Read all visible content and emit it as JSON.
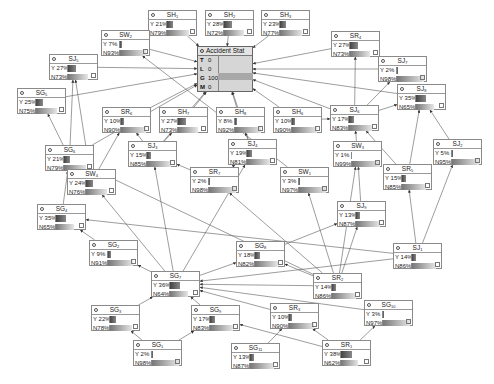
{
  "accident": {
    "title": "Accident Stat",
    "states": [
      {
        "key": "T",
        "value": "0"
      },
      {
        "key": "L",
        "value": "0"
      },
      {
        "key": "G",
        "value": "100%"
      },
      {
        "key": "M",
        "value": "0"
      }
    ]
  },
  "nodes": [
    {
      "id": "SH1",
      "name": "SH",
      "sub": "1",
      "y": "Y 21%",
      "n": "N79%",
      "yp": 21,
      "x": 148,
      "top": 10
    },
    {
      "id": "SH2",
      "name": "SH",
      "sub": "2",
      "y": "Y 28%",
      "n": "N72%",
      "yp": 28,
      "x": 205,
      "top": 10
    },
    {
      "id": "SH3",
      "name": "SH",
      "sub": "3",
      "y": "Y 23%",
      "n": "N77%",
      "yp": 23,
      "x": 261,
      "top": 10
    },
    {
      "id": "SR4",
      "name": "SR",
      "sub": "4",
      "y": "Y 27%",
      "n": "N73%",
      "yp": 27,
      "x": 331,
      "top": 31
    },
    {
      "id": "SW2",
      "name": "SW",
      "sub": "2",
      "y": "Y  7%",
      "n": "N93%",
      "yp": 7,
      "x": 101,
      "top": 30
    },
    {
      "id": "SJ5",
      "name": "SJ",
      "sub": "5",
      "y": "Y 27%",
      "n": "N73%",
      "yp": 27,
      "x": 49,
      "top": 54
    },
    {
      "id": "SJ7",
      "name": "SJ",
      "sub": "7",
      "y": "Y  2%",
      "n": "N98%",
      "yp": 2,
      "x": 378,
      "top": 56
    },
    {
      "id": "SG5",
      "name": "SG",
      "sub": "5",
      "y": "Y 25%",
      "n": "N75%",
      "yp": 25,
      "x": 17,
      "top": 88
    },
    {
      "id": "SJ8",
      "name": "SJ",
      "sub": "8",
      "y": "Y 35%",
      "n": "N65%",
      "yp": 35,
      "x": 397,
      "top": 84
    },
    {
      "id": "SR6",
      "name": "SR",
      "sub": "6",
      "y": "Y 10%",
      "n": "N90%",
      "yp": 10,
      "x": 102,
      "top": 107
    },
    {
      "id": "SH7",
      "name": "SH",
      "sub": "7",
      "y": "Y 27%",
      "n": "N73%",
      "yp": 27,
      "x": 159,
      "top": 107
    },
    {
      "id": "SH8",
      "name": "SH",
      "sub": "8",
      "y": "Y  8%",
      "n": "N92%",
      "yp": 8,
      "x": 216,
      "top": 107
    },
    {
      "id": "SH6",
      "name": "SH",
      "sub": "6",
      "y": "Y 10%",
      "n": "N90%",
      "yp": 10,
      "x": 273,
      "top": 107
    },
    {
      "id": "SJ6",
      "name": "SJ",
      "sub": "6",
      "y": "Y 17%",
      "n": "N83%",
      "yp": 17,
      "x": 330,
      "top": 105
    },
    {
      "id": "SJ3",
      "name": "SJ",
      "sub": "3",
      "y": "Y 15%",
      "n": "N85%",
      "yp": 15,
      "x": 128,
      "top": 141
    },
    {
      "id": "SG6",
      "name": "SG",
      "sub": "6",
      "y": "Y 21%",
      "n": "N79%",
      "yp": 21,
      "x": 45,
      "top": 145
    },
    {
      "id": "SJ4",
      "name": "SJ",
      "sub": "4",
      "y": "Y 19%",
      "n": "N81%",
      "yp": 19,
      "x": 228,
      "top": 139
    },
    {
      "id": "SW3",
      "name": "SW",
      "sub": "3",
      "y": "Y  1%",
      "n": "N99%",
      "yp": 1,
      "x": 333,
      "top": 141
    },
    {
      "id": "SJ2",
      "name": "SJ",
      "sub": "2",
      "y": "Y  5%",
      "n": "N95%",
      "yp": 5,
      "x": 433,
      "top": 139
    },
    {
      "id": "SR7",
      "name": "SR",
      "sub": "7",
      "y": "Y  2%",
      "n": "N98%",
      "yp": 2,
      "x": 190,
      "top": 167
    },
    {
      "id": "SW1",
      "name": "SW",
      "sub": "1",
      "y": "Y  3%",
      "n": "N97%",
      "yp": 3,
      "x": 280,
      "top": 167
    },
    {
      "id": "SR5",
      "name": "SR",
      "sub": "5",
      "y": "Y 15%",
      "n": "N85%",
      "yp": 15,
      "x": 383,
      "top": 164
    },
    {
      "id": "SW4",
      "name": "SW",
      "sub": "4",
      "y": "Y 24%",
      "n": "N76%",
      "yp": 24,
      "x": 67,
      "top": 169
    },
    {
      "id": "SG4",
      "name": "SG",
      "sub": "4",
      "y": "Y 35%",
      "n": "N65%",
      "yp": 35,
      "x": 37,
      "top": 204
    },
    {
      "id": "SJ9",
      "name": "SJ",
      "sub": "9",
      "y": "Y 13%",
      "n": "N87%",
      "yp": 13,
      "x": 337,
      "top": 201
    },
    {
      "id": "SG2",
      "name": "SG",
      "sub": "2",
      "y": "Y  9%",
      "n": "N91%",
      "yp": 9,
      "x": 89,
      "top": 240
    },
    {
      "id": "SG8",
      "name": "SG",
      "sub": "8",
      "y": "Y 18%",
      "n": "N82%",
      "yp": 18,
      "x": 236,
      "top": 241
    },
    {
      "id": "SJ1",
      "name": "SJ",
      "sub": "1",
      "y": "Y 14%",
      "n": "N86%",
      "yp": 14,
      "x": 393,
      "top": 243
    },
    {
      "id": "SG7",
      "name": "SG",
      "sub": "7",
      "y": "Y 36%",
      "n": "N64%",
      "yp": 36,
      "x": 151,
      "top": 271
    },
    {
      "id": "SR2",
      "name": "SR",
      "sub": "2",
      "y": "Y 14%",
      "n": "N86%",
      "yp": 14,
      "x": 313,
      "top": 273
    },
    {
      "id": "SG3",
      "name": "SG",
      "sub": "3",
      "y": "Y 22%",
      "n": "N78%",
      "yp": 22,
      "x": 91,
      "top": 305
    },
    {
      "id": "SG9",
      "name": "SG",
      "sub": "9",
      "y": "Y 17%",
      "n": "N83%",
      "yp": 17,
      "x": 191,
      "top": 305
    },
    {
      "id": "SG10",
      "name": "SG",
      "sub": "10",
      "y": "Y  3%",
      "n": "N97%",
      "yp": 3,
      "x": 364,
      "top": 300
    },
    {
      "id": "SR3",
      "name": "SR",
      "sub": "3",
      "y": "Y 10%",
      "n": "N90%",
      "yp": 10,
      "x": 270,
      "top": 303
    },
    {
      "id": "SG1",
      "name": "SG",
      "sub": "1",
      "y": "Y  2%",
      "n": "N98%",
      "yp": 2,
      "x": 133,
      "top": 340
    },
    {
      "id": "SG11",
      "name": "SG",
      "sub": "11",
      "y": "Y 13%",
      "n": "N87%",
      "yp": 13,
      "x": 231,
      "top": 343
    },
    {
      "id": "SR1",
      "name": "SR",
      "sub": "1",
      "y": "Y 38%",
      "n": "N62%",
      "yp": 38,
      "x": 322,
      "top": 340
    }
  ],
  "edges": [
    [
      "SH1",
      "ACC"
    ],
    [
      "SH2",
      "ACC"
    ],
    [
      "SH3",
      "ACC"
    ],
    [
      "SR4",
      "ACC"
    ],
    [
      "SW2",
      "ACC"
    ],
    [
      "SJ5",
      "ACC"
    ],
    [
      "SJ7",
      "ACC"
    ],
    [
      "SJ8",
      "ACC"
    ],
    [
      "SR6",
      "ACC"
    ],
    [
      "SH7",
      "ACC"
    ],
    [
      "SH8",
      "ACC"
    ],
    [
      "SH6",
      "ACC"
    ],
    [
      "SJ6",
      "ACC"
    ],
    [
      "SG5",
      "ACC"
    ],
    [
      "SG6",
      "ACC"
    ],
    [
      "SJ3",
      "ACC"
    ],
    [
      "SJ4",
      "ACC"
    ],
    [
      "SJ6",
      "SR4"
    ],
    [
      "SJ6",
      "SJ7"
    ],
    [
      "SJ6",
      "SJ8"
    ],
    [
      "SH6",
      "SJ6"
    ],
    [
      "SW3",
      "SJ6"
    ],
    [
      "SR5",
      "SJ6"
    ],
    [
      "SR5",
      "SJ8"
    ],
    [
      "SJ2",
      "SJ8"
    ],
    [
      "SG6",
      "SG5"
    ],
    [
      "SG6",
      "SJ5"
    ],
    [
      "SG4",
      "SG6"
    ],
    [
      "SW4",
      "SJ5"
    ],
    [
      "SW4",
      "SR6"
    ],
    [
      "SW4",
      "SG6"
    ],
    [
      "SJ3",
      "SR6"
    ],
    [
      "SJ3",
      "SH7"
    ],
    [
      "SR7",
      "SJ3"
    ],
    [
      "SR7",
      "SJ4"
    ],
    [
      "SJ4",
      "SH8"
    ],
    [
      "SG7",
      "SJ3"
    ],
    [
      "SG7",
      "SW4"
    ],
    [
      "SG7",
      "SJ4"
    ],
    [
      "SG7",
      "SG8"
    ],
    [
      "SG2",
      "SG4"
    ],
    [
      "SG7",
      "SG2"
    ],
    [
      "SJ1",
      "SG4"
    ],
    [
      "SJ1",
      "SG7"
    ],
    [
      "SJ1",
      "SJ2"
    ],
    [
      "SJ1",
      "SR5"
    ],
    [
      "SR2",
      "SJ9"
    ],
    [
      "SR2",
      "SW1"
    ],
    [
      "SR2",
      "SW3"
    ],
    [
      "SR2",
      "SG7"
    ],
    [
      "SR2",
      "SG8"
    ],
    [
      "SR2",
      "SG6"
    ],
    [
      "SR2",
      "SR7"
    ],
    [
      "SJ9",
      "SW3"
    ],
    [
      "SG8",
      "SJ9"
    ],
    [
      "SG3",
      "SG7"
    ],
    [
      "SG9",
      "SG7"
    ],
    [
      "SG1",
      "SG3"
    ],
    [
      "SG1",
      "SG9"
    ],
    [
      "SG10",
      "SG7"
    ],
    [
      "SR1",
      "SR3"
    ],
    [
      "SR1",
      "SG10"
    ],
    [
      "SR1",
      "SG9"
    ],
    [
      "SR3",
      "SG7"
    ],
    [
      "SG11",
      "SR3"
    ],
    [
      "SW1",
      "SW2"
    ]
  ]
}
